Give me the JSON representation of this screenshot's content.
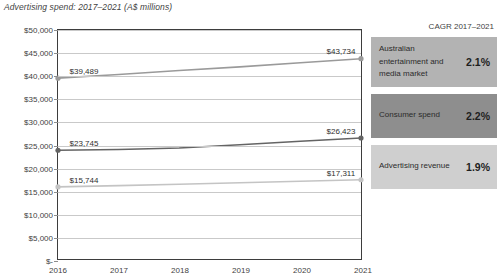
{
  "title": "Advertising spend: 2017–2021 (A$ millions)",
  "chart_data": {
    "type": "line",
    "title": "Advertising spend: 2017–2021 (A$ millions)",
    "xlabel": "",
    "ylabel": "",
    "categories": [
      "2016",
      "2017",
      "2018",
      "2019",
      "2020",
      "2021"
    ],
    "ylim": [
      0,
      50000
    ],
    "yticks": [
      0,
      5000,
      10000,
      15000,
      20000,
      25000,
      30000,
      35000,
      40000,
      45000,
      50000
    ],
    "ytick_labels": [
      "$-",
      "$5,000",
      "$10,000",
      "$15,000",
      "$20,000",
      "$25,000",
      "$30,000",
      "$35,000",
      "$40,000",
      "$45,000",
      "$50,000"
    ],
    "grid": true,
    "legend_position": "right",
    "series": [
      {
        "name": "Australian entertainment and media market",
        "color": "#9a9a9a",
        "values": [
          39489,
          40300,
          41150,
          41950,
          42850,
          43734
        ],
        "labels": {
          "first": "$39,489",
          "last": "$43,734"
        }
      },
      {
        "name": "Consumer spend",
        "color": "#646464",
        "values": [
          23745,
          23900,
          24250,
          24950,
          25700,
          26423
        ],
        "labels": {
          "first": "$23,745",
          "last": "$26,423"
        }
      },
      {
        "name": "Advertising revenue",
        "color": "#c4c4c4",
        "values": [
          15744,
          16020,
          16330,
          16650,
          16980,
          17311
        ],
        "labels": {
          "first": "$15,744",
          "last": "$17,311"
        }
      }
    ]
  },
  "cagr": {
    "header": "CAGR 2017–2021",
    "rows": [
      {
        "name": "Australian entertainment and media market",
        "value": "2.1%",
        "bg": "#b3b3b3"
      },
      {
        "name": "Consumer spend",
        "value": "2.2%",
        "bg": "#8e8e8e"
      },
      {
        "name": "Advertising revenue",
        "value": "1.9%",
        "bg": "#cfcfcf"
      }
    ]
  }
}
